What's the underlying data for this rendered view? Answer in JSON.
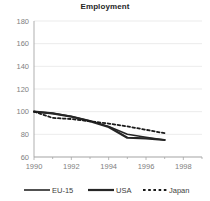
{
  "chart_data": {
    "type": "line",
    "title": "Employment",
    "xlabel": "",
    "ylabel": "",
    "xlim": [
      1990,
      1999
    ],
    "ylim": [
      60,
      180
    ],
    "grid": true,
    "grid_axis": "y",
    "legend_position": "bottom",
    "x": [
      1990,
      1991,
      1992,
      1993,
      1994,
      1995,
      1996,
      1997
    ],
    "xticks": [
      "1990",
      "1992",
      "1994",
      "1996",
      "1998"
    ],
    "xtick_values": [
      1990,
      1992,
      1994,
      1996,
      1998
    ],
    "yticks": [
      "60",
      "80",
      "100",
      "120",
      "140",
      "160",
      "180"
    ],
    "ytick_values": [
      60,
      80,
      100,
      120,
      140,
      160,
      180
    ],
    "series": [
      {
        "name": "EU-15",
        "style": "solid",
        "color": "#262626",
        "width": 1.6,
        "values": [
          100,
          98.5,
          96,
          92,
          87,
          80,
          77.5,
          75
        ]
      },
      {
        "name": "USA",
        "style": "solid",
        "color": "#262626",
        "width": 2.2,
        "values": [
          100,
          98.5,
          95.5,
          91.5,
          86.5,
          77,
          76.5,
          75
        ]
      },
      {
        "name": "Japan",
        "style": "dashed",
        "color": "#1a1a1a",
        "width": 1.8,
        "values": [
          100,
          94.5,
          93.5,
          91.5,
          89.5,
          87,
          84,
          81
        ]
      }
    ]
  },
  "legend": {
    "items": [
      {
        "label": "EU-15",
        "style": "solid"
      },
      {
        "label": "USA",
        "style": "solid"
      },
      {
        "label": "Japan",
        "style": "dashed"
      }
    ]
  },
  "colors": {
    "axis": "#a6a6a6",
    "grid": "#e6e6e6",
    "tick_text": "#808080",
    "title_text": "#262626",
    "line": "#262626",
    "background": "#ffffff"
  }
}
